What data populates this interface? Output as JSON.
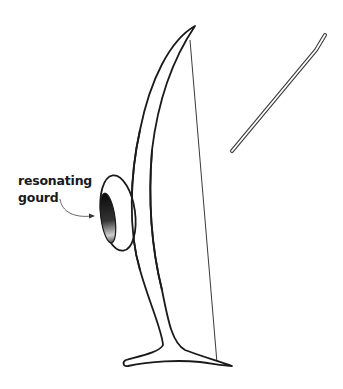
{
  "diagram": {
    "labels": [
      {
        "id": "gourd-label",
        "lines": [
          "resonating",
          "gourd"
        ],
        "points_to": "resonating-gourd"
      }
    ],
    "parts": [
      "bow-stave",
      "bow-string",
      "resonating-gourd",
      "striking-stick"
    ],
    "colors": {
      "stroke": "#1a1a1a",
      "string": "#3a3a3a",
      "background": "#ffffff"
    }
  }
}
